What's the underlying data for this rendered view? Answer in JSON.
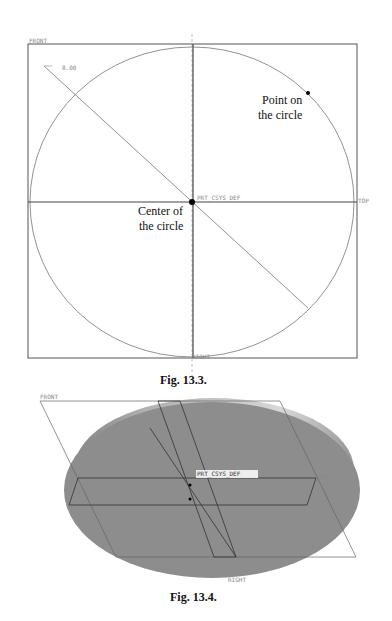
{
  "figures": [
    {
      "caption": "Fig. 13.3.",
      "plane_labels": {
        "front": "FRONT",
        "top": "TOP",
        "right": "RIGHT"
      },
      "dimension": "8.00",
      "csys_label": "PRT_CSYS_DEF",
      "annotations": {
        "point_line1": "Point on",
        "point_line2": "the circle",
        "center_line1": "Center of",
        "center_line2": "the circle"
      }
    },
    {
      "caption": "Fig. 13.4.",
      "plane_labels": {
        "front": "FRONT",
        "top": "TOP",
        "right": "RIGHT"
      },
      "csys_label": "PRT_CSYS_DEF"
    }
  ]
}
